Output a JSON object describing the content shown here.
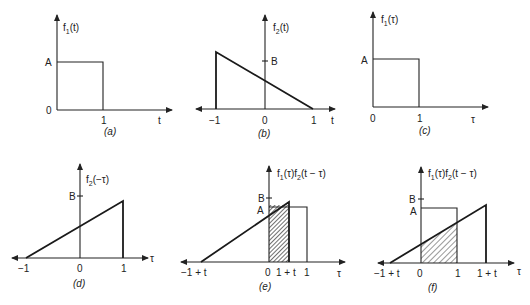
{
  "figure": {
    "panels": [
      {
        "id": "a",
        "caption": "(a)",
        "ylabel": "f1(t)",
        "xlabel": "t",
        "yticks": [
          "A",
          "0"
        ],
        "xticks": [
          "1"
        ],
        "shape": "rectangle from t=0 to t=1 with height A"
      },
      {
        "id": "b",
        "caption": "(b)",
        "ylabel": "f2(t)",
        "xlabel": "t",
        "yticks": [
          "B"
        ],
        "xticks": [
          "-1",
          "0",
          "1"
        ],
        "shape": "triangle, vertical edge at t=-1, decreasing linearly to zero at t=1"
      },
      {
        "id": "c",
        "caption": "(c)",
        "ylabel": "f1(τ)",
        "xlabel": "τ",
        "yticks": [
          "A"
        ],
        "xticks": [
          "0",
          "1"
        ],
        "shape": "rectangle from τ=0 to τ=1 with height A"
      },
      {
        "id": "d",
        "caption": "(d)",
        "ylabel": "f2(−τ)",
        "xlabel": "τ",
        "yticks": [
          "B"
        ],
        "xticks": [
          "−1",
          "0",
          "1"
        ],
        "shape": "triangle rising linearly from τ=-1 to vertical edge at τ=1"
      },
      {
        "id": "e",
        "caption": "(e)",
        "ylabel": "f1(τ)f2(t − τ)",
        "xlabel": "τ",
        "yticks": [
          "B",
          "A"
        ],
        "xticks": [
          "−1 + t",
          "0",
          "1 + t",
          "1"
        ],
        "shape": "overlap shaded from τ=0 to τ=1+t"
      },
      {
        "id": "f",
        "caption": "(f)",
        "ylabel": "f1(τ)f2(t − τ)",
        "xlabel": "τ",
        "yticks": [
          "B",
          "A"
        ],
        "xticks": [
          "−1 + t",
          "0",
          "1",
          "1 + t"
        ],
        "shape": "overlap shaded from τ=0 to τ=1"
      }
    ]
  },
  "labels": {
    "a": {
      "f": "f",
      "sub": "1",
      "arg": "(t)",
      "A": "A",
      "zero": "0",
      "one": "1",
      "t": "t",
      "cap": "(a)"
    },
    "b": {
      "f": "f",
      "sub": "2",
      "arg": "(t)",
      "B": "B",
      "m1": "−1",
      "zero": "0",
      "one": "1",
      "t": "t",
      "cap": "(b)"
    },
    "c": {
      "f": "f",
      "sub": "1",
      "arg": "(τ)",
      "A": "A",
      "zero": "0",
      "one": "1",
      "tau": "τ",
      "cap": "(c)"
    },
    "d": {
      "f": "f",
      "sub": "2",
      "arg": "(−τ)",
      "B": "B",
      "m1": "−1",
      "zero": "0",
      "one": "1",
      "tau": "τ",
      "cap": "(d)"
    },
    "e": {
      "f1": "f",
      "sub1": "1",
      "arg1": "(τ)f",
      "sub2": "2",
      "arg2": "(t − τ)",
      "B": "B",
      "A": "A",
      "m1t": "−1 + t",
      "zero": "0",
      "onept": "1 + t",
      "one": "1",
      "tau": "τ",
      "cap": "(e)"
    },
    "f": {
      "f1": "f",
      "sub1": "1",
      "arg1": "(τ)f",
      "sub2": "2",
      "arg2": "(t − τ)",
      "B": "B",
      "A": "A",
      "m1t": "−1 + t",
      "zero": "0",
      "one": "1",
      "onept": "1 + t",
      "tau": "τ",
      "cap": "(f)"
    }
  }
}
